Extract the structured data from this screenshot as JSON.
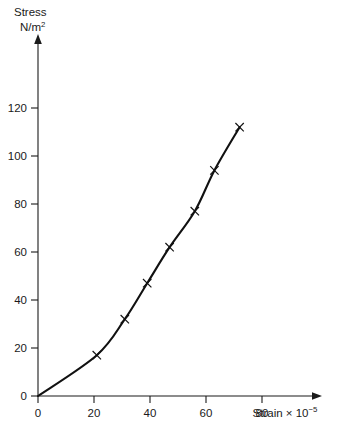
{
  "chart_data": {
    "type": "line",
    "title": "",
    "subtitle": "",
    "ylabel_line1": "Stress",
    "ylabel_line2": "N/m",
    "ylabel_line2_sup": "2",
    "xlabel_main": "Strain × 10",
    "xlabel_sup": "−5",
    "xlabel_full": "Strain × 10−5",
    "ylabel_full": "Stress N/m²",
    "origin_label": "0",
    "x_ticks": [
      0,
      20,
      40,
      60,
      80
    ],
    "y_ticks": [
      0,
      20,
      40,
      60,
      80,
      100,
      120
    ],
    "xlim": [
      0,
      88
    ],
    "ylim": [
      0,
      128
    ],
    "grid": false,
    "legend": "none",
    "marker_style": "cross",
    "series": [
      {
        "name": "stress-strain",
        "x": [
          0,
          21,
          31,
          39,
          47,
          56,
          63,
          72
        ],
        "y": [
          0,
          17,
          32,
          47,
          62,
          77,
          94,
          112
        ],
        "markers_x": [
          21,
          31,
          39,
          47,
          56,
          63,
          72
        ],
        "markers_y": [
          17,
          32,
          47,
          62,
          77,
          94,
          112
        ]
      }
    ],
    "colors": {
      "curve": "#111111",
      "axis": "#1a1a1a",
      "background": "#ffffff"
    }
  }
}
